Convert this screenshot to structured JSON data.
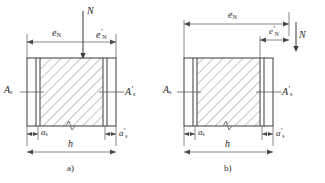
{
  "figure": {
    "title_absent": true,
    "type": "engineering-cross-section-diagram",
    "line_color": "#3a3a3a",
    "hatch_color": "#7a7a7a",
    "text_color": "#2a2a2a"
  },
  "panel_a": {
    "caption": "a)",
    "load_label": "N",
    "ecc_left_label": "e",
    "ecc_left_sub": "N",
    "ecc_right_label": "e",
    "ecc_right_sub": "N",
    "ecc_right_prime": "′",
    "steel_left_label": "A",
    "steel_left_sub": "s",
    "steel_right_label": "A",
    "steel_right_sub": "s",
    "steel_right_prime": "′",
    "cover_left_label": "a",
    "cover_left_sub": "s",
    "cover_right_label": "a",
    "cover_right_sub": "s",
    "cover_right_prime": "′",
    "width_label": "h"
  },
  "panel_b": {
    "caption": "b)",
    "load_label": "N",
    "ecc_left_label": "e",
    "ecc_left_sub": "N",
    "ecc_right_label": "e",
    "ecc_right_sub": "N",
    "ecc_right_prime": "′",
    "steel_left_label": "A",
    "steel_left_sub": "s",
    "steel_right_label": "A",
    "steel_right_sub": "s",
    "steel_right_prime": "′",
    "cover_left_label": "a",
    "cover_left_sub": "s",
    "cover_right_label": "a",
    "cover_right_sub": "s",
    "cover_right_prime": "′",
    "width_label": "h"
  }
}
